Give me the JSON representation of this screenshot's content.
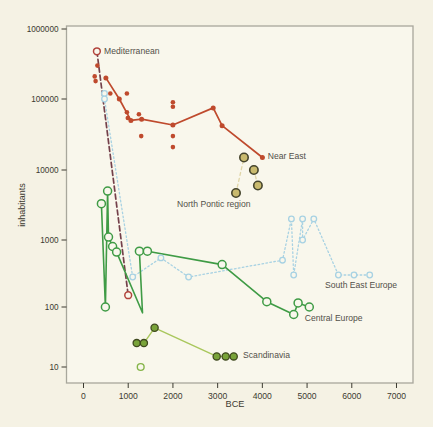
{
  "figure": {
    "width": 433,
    "height": 427,
    "background": "#f5f2e4",
    "plot_background": "#f9f7ec",
    "frame_color": "#a8a79c"
  },
  "chart_data": {
    "type": "scatter",
    "title": "",
    "xlabel": "BCE",
    "ylabel": "inhabitants",
    "x_ticks": [
      0,
      1000,
      2000,
      3000,
      4000,
      5000,
      6000,
      7000
    ],
    "y_ticks": [
      10,
      100,
      1000,
      10000,
      100000,
      1000000
    ],
    "x_range": [
      0,
      7350
    ],
    "y_scale": "log",
    "y_range": [
      8,
      1300000
    ],
    "grid": false,
    "legend_position": "inline-labels",
    "label_color": "#52504a",
    "tick_color": "#3c3a30",
    "series": [
      {
        "id": "mediterranean",
        "label": "Mediterranean",
        "label_anchor": [
          460,
          440000
        ],
        "label_align": "start",
        "line": {
          "color": "#74404a",
          "width": 1.7,
          "dash": "5,3"
        },
        "marker": {
          "shape": "circle",
          "r": 3.4,
          "stroke": "#b2443c",
          "stroke_width": 1.5,
          "fill": "#f9f7ec"
        },
        "points": [
          [
            300,
            480000
          ],
          [
            1000,
            150
          ]
        ]
      },
      {
        "id": "near-east",
        "label": "Near East",
        "label_anchor": [
          4120,
          14500
        ],
        "label_align": "start",
        "line": {
          "color": "#bf4a2d",
          "width": 1.7,
          "dash": ""
        },
        "marker": {
          "shape": "circle",
          "r": 2.5,
          "stroke": "#bf4a2d",
          "stroke_width": 0,
          "fill": "#bf4a2d"
        },
        "points": [
          [
            500,
            200000
          ],
          [
            800,
            100000
          ],
          [
            1060,
            50000
          ],
          [
            1300,
            52000
          ],
          [
            2000,
            43000
          ],
          [
            2900,
            75000
          ],
          [
            3100,
            42000
          ],
          [
            4000,
            15000
          ]
        ]
      },
      {
        "id": "near-east-settlements",
        "label": "",
        "line": null,
        "marker": {
          "shape": "circle",
          "r": 2.3,
          "stroke": "#bf4a2d",
          "stroke_width": 0,
          "fill": "#bf4a2d"
        },
        "points": [
          [
            250,
            210000
          ],
          [
            270,
            180000
          ],
          [
            310,
            300000
          ],
          [
            600,
            120000
          ],
          [
            970,
            120000
          ],
          [
            970,
            65000
          ],
          [
            990,
            54000
          ],
          [
            1240,
            61000
          ],
          [
            1290,
            30000
          ],
          [
            2000,
            90000
          ],
          [
            2000,
            78000
          ],
          [
            2000,
            30000
          ],
          [
            2000,
            21000
          ]
        ]
      },
      {
        "id": "north-pontic",
        "label": "North Pontic region",
        "label_anchor": [
          2090,
          2960
        ],
        "label_align": "start",
        "line": {
          "color": "#e0d6a8",
          "width": 1.3,
          "dash": "3,3"
        },
        "segments": [
          [
            [
              3410,
              4700
            ],
            [
              3590,
              15000
            ]
          ],
          [
            [
              3810,
              10000
            ],
            [
              3900,
              6000
            ]
          ]
        ],
        "marker": {
          "shape": "circle",
          "r": 4.2,
          "stroke": "#45442c",
          "stroke_width": 1.6,
          "fill": "#c9ba6e"
        },
        "points": [
          [
            3410,
            4700
          ],
          [
            3590,
            15000
          ],
          [
            3810,
            10000
          ],
          [
            3900,
            6000
          ]
        ]
      },
      {
        "id": "south-east-europe",
        "label": "South East Europe",
        "label_anchor": [
          5400,
          190
        ],
        "label_align": "start",
        "line": {
          "color": "#a8d2e3",
          "width": 1.3,
          "dash": "1.6,2.4"
        },
        "marker": {
          "shape": "circle",
          "r": 2.8,
          "stroke": "#a8d2e3",
          "stroke_width": 1.3,
          "fill": "#f9f7ec"
        },
        "points": [
          [
            470,
            120000
          ],
          [
            470,
            100000
          ],
          [
            1100,
            280
          ],
          [
            1730,
            540
          ],
          [
            2350,
            280
          ],
          [
            4450,
            500
          ],
          [
            4650,
            2000
          ],
          [
            4700,
            300
          ],
          [
            4900,
            2000
          ],
          [
            4900,
            1000
          ],
          [
            5150,
            2000
          ],
          [
            5700,
            300
          ],
          [
            6050,
            300
          ],
          [
            6400,
            300
          ]
        ]
      },
      {
        "id": "central-europe",
        "label": "Central Europe",
        "label_anchor": [
          4950,
          58
        ],
        "label_align": "start",
        "line": {
          "color": "#3f9b45",
          "width": 1.6,
          "dash": ""
        },
        "marker": {
          "shape": "circle",
          "r": 4,
          "stroke": "#3f9b45",
          "stroke_width": 1.5,
          "fill": "#f9f7ec"
        },
        "skip_marker_indices": [
          6
        ],
        "points": [
          [
            400,
            3300
          ],
          [
            490,
            100
          ],
          [
            540,
            5000
          ],
          [
            560,
            1100
          ],
          [
            650,
            800
          ],
          [
            740,
            660
          ],
          [
            1320,
            80
          ],
          [
            1250,
            680
          ],
          [
            1430,
            680
          ],
          [
            3100,
            430
          ],
          [
            4100,
            120
          ],
          [
            4700,
            75
          ],
          [
            4800,
            115
          ],
          [
            5050,
            100
          ]
        ]
      },
      {
        "id": "scandinavia",
        "label": "Scandinavia",
        "label_anchor": [
          3570,
          14
        ],
        "label_align": "start",
        "line": {
          "color": "#a9c75c",
          "width": 1.4,
          "dash": ""
        },
        "marker": {
          "shape": "circle",
          "r": 3.6,
          "stroke": "#404a1f",
          "stroke_width": 1.3,
          "fill": "#79a339"
        },
        "points": [
          [
            1190,
            25
          ],
          [
            1350,
            25
          ],
          [
            1590,
            45
          ],
          [
            2980,
            15
          ],
          [
            3180,
            15
          ],
          [
            3360,
            15
          ]
        ]
      },
      {
        "id": "scandinavia-outlier",
        "label": "",
        "line": null,
        "marker": {
          "shape": "circle",
          "r": 3.4,
          "stroke": "#86b54a",
          "stroke_width": 1.4,
          "fill": "#f9f7ec"
        },
        "points": [
          [
            1280,
            10
          ]
        ]
      }
    ]
  }
}
